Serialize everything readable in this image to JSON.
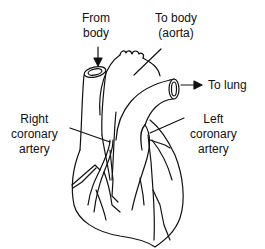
{
  "diagram": {
    "labels": {
      "from_body": "From\nbody",
      "to_body": "To body\n(aorta)",
      "to_lung": "To lung",
      "right_coronary": "Right\ncoronary\nartery",
      "left_coronary": "Left\ncoronary\nartery"
    },
    "colors": {
      "line": "#111111",
      "background": "#ffffff"
    }
  }
}
